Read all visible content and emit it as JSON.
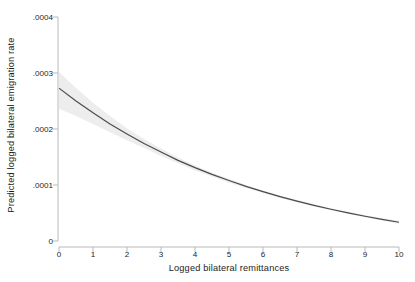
{
  "chart_data": {
    "type": "line",
    "title": "",
    "subtitle": "",
    "xlabel": "Logged bilateral remittances",
    "ylabel": "Predicted logged bilateral emigration rate",
    "xlim": [
      0,
      10
    ],
    "ylim": [
      0,
      0.0004
    ],
    "grid": false,
    "legend": null,
    "xticks": [
      0,
      1,
      2,
      3,
      4,
      5,
      6,
      7,
      8,
      9,
      10
    ],
    "xtick_labels": [
      "0",
      "1",
      "2",
      "3",
      "4",
      "5",
      "6",
      "7",
      "8",
      "9",
      "10"
    ],
    "yticks": [
      0,
      0.0001,
      0.0002,
      0.0003,
      0.0004
    ],
    "ytick_labels": [
      "0",
      ".0001",
      ".0002",
      ".0003",
      ".0004"
    ],
    "series": [
      {
        "name": "Predicted logged bilateral emigration rate",
        "kind": "line",
        "color": "#4a4a4a",
        "x": [
          0,
          0.5,
          1,
          1.5,
          2,
          2.5,
          3,
          3.5,
          4,
          4.5,
          5,
          5.5,
          6,
          6.5,
          7,
          7.5,
          8,
          8.5,
          9,
          9.5,
          10
        ],
        "y": [
          0.000273,
          0.00025,
          0.000229,
          0.000209,
          0.000191,
          0.000174,
          0.000159,
          0.000144,
          0.000131,
          0.000119,
          0.000108,
          9.75e-05,
          8.81e-05,
          7.93e-05,
          7.12e-05,
          6.37e-05,
          5.68e-05,
          5.03e-05,
          4.43e-05,
          3.87e-05,
          3.34e-05
        ]
      },
      {
        "name": "95% confidence interval",
        "kind": "band",
        "color": "#ededed",
        "x": [
          0,
          0.5,
          1,
          1.5,
          2,
          2.5,
          3,
          3.5,
          4,
          4.5,
          5,
          5.5,
          6,
          6.5,
          7,
          7.5,
          8,
          8.5,
          9,
          9.5,
          10
        ],
        "y_upper": [
          0.000302,
          0.000273,
          0.000247,
          0.000223,
          0.000201,
          0.000182,
          0.000165,
          0.000149,
          0.000135,
          0.000122,
          0.000111,
          0.0001,
          9.03e-05,
          8.13e-05,
          7.31e-05,
          6.56e-05,
          5.87e-05,
          5.23e-05,
          4.64e-05,
          4.1e-05,
          3.6e-05
        ],
        "y_lower": [
          0.000236,
          0.000223,
          0.000209,
          0.000194,
          0.00018,
          0.000166,
          0.000152,
          0.000139,
          0.000126,
          0.000115,
          0.000104,
          9.45e-05,
          8.55e-05,
          7.7e-05,
          6.91e-05,
          6.17e-05,
          5.48e-05,
          4.83e-05,
          4.22e-05,
          3.65e-05,
          3.1e-05
        ]
      }
    ],
    "annotations": []
  },
  "axes": {
    "axis_color": "#b9b9b9",
    "tick_color": "#b9b9b9",
    "text_color": "#1c1c1c",
    "background": "#ffffff"
  }
}
